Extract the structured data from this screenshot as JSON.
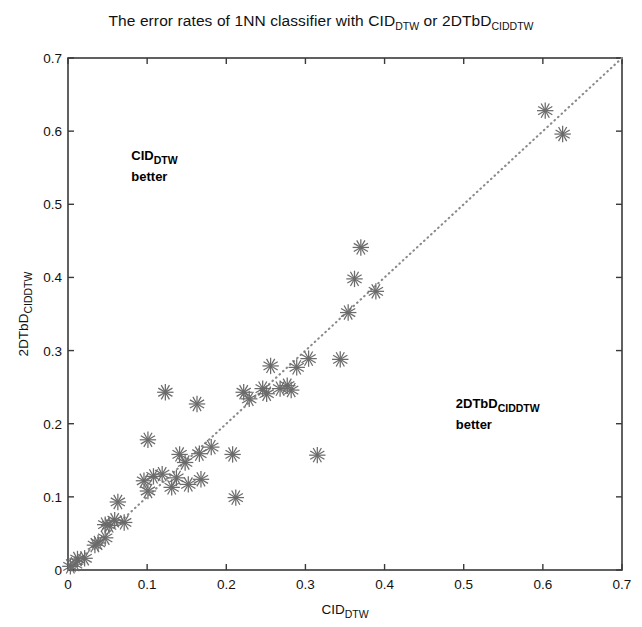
{
  "chart_data": {
    "type": "scatter",
    "title_parts": {
      "segment1": "The error rates of 1NN classifier with CID",
      "sub1": "DTW",
      "segment2": " or 2DTbD",
      "sub2": "CIDDTW"
    },
    "xlabel": "CID_DTW",
    "xlabel_parts": {
      "base": "CID",
      "sub": "DTW"
    },
    "ylabel": "2DTbD_CIDDTW",
    "ylabel_parts": {
      "base": "2DTbD",
      "sub": "CIDDTW"
    },
    "xlim": [
      0,
      0.7
    ],
    "ylim": [
      0,
      0.7
    ],
    "xticks": [
      0,
      0.1,
      0.2,
      0.3,
      0.4,
      0.5,
      0.6,
      0.7
    ],
    "yticks": [
      0,
      0.1,
      0.2,
      0.3,
      0.4,
      0.5,
      0.6,
      0.7
    ],
    "xtick_labels": [
      "0",
      "0.1",
      "0.2",
      "0.3",
      "0.4",
      "0.5",
      "0.6",
      "0.7"
    ],
    "ytick_labels": [
      "0",
      "0.1",
      "0.2",
      "0.3",
      "0.4",
      "0.5",
      "0.6",
      "0.7"
    ],
    "grid": false,
    "legend": "none",
    "marker": "asterisk",
    "marker_color": "#6b6b6b",
    "reference_line": {
      "style": "dotted",
      "color": "#8a8a8a",
      "from": [
        0,
        0
      ],
      "to": [
        0.7,
        0.7
      ],
      "description": "y = x diagonal"
    },
    "annotations": [
      {
        "name": "cid-better",
        "text": "CID_DTW better",
        "base": "CID",
        "sub": "DTW",
        "line2": "better",
        "x": 0.08,
        "y": 0.565
      },
      {
        "name": "2dtbd-better",
        "text": "2DTbD_CIDDTW better",
        "base": "2DTbD",
        "sub": "CIDDTW",
        "line2": "better",
        "x": 0.49,
        "y": 0.225
      }
    ],
    "points": [
      [
        0.003,
        0.005
      ],
      [
        0.009,
        0.008
      ],
      [
        0.012,
        0.015
      ],
      [
        0.021,
        0.016
      ],
      [
        0.034,
        0.034
      ],
      [
        0.038,
        0.037
      ],
      [
        0.047,
        0.044
      ],
      [
        0.047,
        0.062
      ],
      [
        0.052,
        0.061
      ],
      [
        0.059,
        0.068
      ],
      [
        0.063,
        0.093
      ],
      [
        0.071,
        0.065
      ],
      [
        0.096,
        0.122
      ],
      [
        0.101,
        0.178
      ],
      [
        0.101,
        0.108
      ],
      [
        0.108,
        0.128
      ],
      [
        0.119,
        0.131
      ],
      [
        0.123,
        0.243
      ],
      [
        0.131,
        0.113
      ],
      [
        0.137,
        0.126
      ],
      [
        0.141,
        0.158
      ],
      [
        0.148,
        0.147
      ],
      [
        0.152,
        0.117
      ],
      [
        0.163,
        0.227
      ],
      [
        0.166,
        0.159
      ],
      [
        0.168,
        0.124
      ],
      [
        0.181,
        0.168
      ],
      [
        0.208,
        0.158
      ],
      [
        0.212,
        0.099
      ],
      [
        0.222,
        0.243
      ],
      [
        0.229,
        0.234
      ],
      [
        0.246,
        0.248
      ],
      [
        0.251,
        0.241
      ],
      [
        0.256,
        0.279
      ],
      [
        0.268,
        0.248
      ],
      [
        0.277,
        0.252
      ],
      [
        0.282,
        0.246
      ],
      [
        0.289,
        0.277
      ],
      [
        0.304,
        0.289
      ],
      [
        0.315,
        0.157
      ],
      [
        0.344,
        0.288
      ],
      [
        0.354,
        0.352
      ],
      [
        0.362,
        0.398
      ],
      [
        0.37,
        0.441
      ],
      [
        0.389,
        0.381
      ],
      [
        0.603,
        0.628
      ],
      [
        0.625,
        0.596
      ]
    ]
  },
  "figure": {
    "plot_box": {
      "left": 68,
      "top": 58,
      "right": 622,
      "bottom": 570
    },
    "background_color": "#ffffff",
    "axis_color": "#3a3a3a"
  }
}
